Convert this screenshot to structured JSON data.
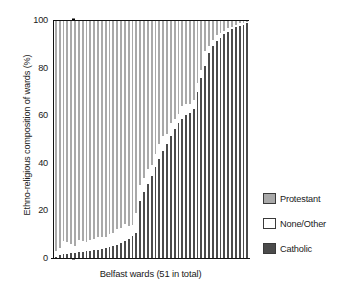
{
  "chart_data": {
    "type": "bar",
    "subtype": "stacked-bar-100-percent",
    "title": "",
    "xlabel": "Belfast wards (51 in total)",
    "ylabel": "Ethno-religious composition of wards (%)",
    "ylim": [
      0,
      100
    ],
    "yticks": [
      0,
      20,
      40,
      60,
      80,
      100
    ],
    "ytick_labels": [
      "0",
      "20",
      "40",
      "60",
      "80",
      "100"
    ],
    "grid": false,
    "legend_position": "right",
    "stack_order_bottom_to_top": [
      "Catholic",
      "None/Other",
      "Protestant"
    ],
    "categories": [
      "1",
      "2",
      "3",
      "4",
      "5",
      "6",
      "7",
      "8",
      "9",
      "10",
      "11",
      "12",
      "13",
      "14",
      "15",
      "16",
      "17",
      "18",
      "19",
      "20",
      "21",
      "22",
      "23",
      "24",
      "25",
      "26",
      "27",
      "28",
      "29",
      "30",
      "31",
      "32",
      "33",
      "34",
      "35",
      "36",
      "37",
      "38",
      "39",
      "40",
      "41",
      "42",
      "43",
      "44",
      "45",
      "46",
      "47",
      "48",
      "49",
      "50",
      "51"
    ],
    "series": [
      {
        "name": "Catholic",
        "color": "#4b4b4b",
        "values": [
          1.0,
          1.5,
          2.0,
          2.2,
          2.4,
          2.6,
          2.8,
          3.0,
          3.2,
          3.4,
          3.6,
          3.8,
          4.2,
          4.6,
          5.0,
          5.4,
          6.0,
          6.6,
          7.4,
          8.4,
          9.6,
          11.0,
          24.5,
          28.0,
          31.5,
          35.0,
          38.5,
          42.0,
          45.5,
          48.5,
          51.5,
          54.5,
          57.0,
          59.0,
          60.5,
          61.5,
          63.0,
          70.0,
          76.0,
          81.0,
          86.5,
          89.5,
          91.5,
          93.0,
          94.5,
          95.5,
          96.5,
          97.5,
          98.0,
          98.5,
          99.0
        ]
      },
      {
        "name": "None/Other",
        "color": "#ffffff",
        "values": [
          2.5,
          3.0,
          5.5,
          5.0,
          4.0,
          3.0,
          5.0,
          4.5,
          4.0,
          4.5,
          5.0,
          5.5,
          5.0,
          4.5,
          5.5,
          5.5,
          6.5,
          6.5,
          7.5,
          5.5,
          4.5,
          8.5,
          6.5,
          6.0,
          6.5,
          4.5,
          5.5,
          6.5,
          6.0,
          4.0,
          5.5,
          4.5,
          4.0,
          5.5,
          4.5,
          3.5,
          4.0,
          4.0,
          3.5,
          6.5,
          3.0,
          2.5,
          2.5,
          2.0,
          1.5,
          1.5,
          1.0,
          1.0,
          1.0,
          0.8,
          0.6
        ]
      },
      {
        "name": "Protestant",
        "color": "#a9a9a9",
        "values": [
          96.5,
          95.5,
          92.5,
          92.8,
          93.6,
          94.4,
          92.2,
          92.5,
          92.8,
          92.1,
          91.4,
          90.7,
          90.8,
          90.9,
          89.5,
          89.1,
          87.5,
          86.9,
          85.1,
          86.1,
          85.9,
          80.5,
          69.0,
          66.0,
          62.0,
          60.5,
          56.0,
          51.5,
          48.5,
          47.5,
          43.0,
          41.0,
          39.0,
          35.5,
          35.0,
          35.0,
          33.0,
          26.0,
          20.5,
          12.5,
          10.5,
          8.0,
          6.0,
          5.0,
          4.0,
          3.0,
          2.5,
          1.5,
          1.0,
          0.7,
          0.4
        ]
      }
    ]
  },
  "legend": {
    "items": [
      {
        "label": "Protestant",
        "swatch": "protestant-swatch"
      },
      {
        "label": "None/Other",
        "swatch": "none-other-swatch"
      },
      {
        "label": "Catholic",
        "swatch": "catholic-swatch"
      }
    ]
  },
  "colors": {
    "protestant": "#a9a9a9",
    "none_other": "#ffffff",
    "catholic": "#4b4b4b",
    "axis": "#111111",
    "text": "#1a1a1a",
    "background": "#ffffff"
  }
}
